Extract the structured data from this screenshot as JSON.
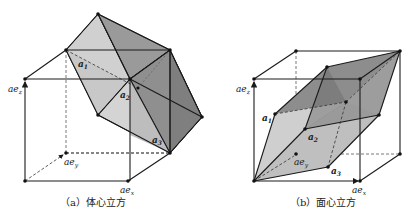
{
  "figures": [
    {
      "id": "bcc",
      "caption": "（a）体心立方",
      "labels": {
        "ez": "ae",
        "ez_sub": "z",
        "ey": "ae",
        "ey_sub": "y",
        "ex": "ae",
        "ex_sub": "x",
        "a1": "a",
        "a1_sub": "1",
        "a2": "a",
        "a2_sub": "2",
        "a3": "a",
        "a3_sub": "3"
      }
    },
    {
      "id": "fcc",
      "caption": "（b）面心立方",
      "labels": {
        "ez": "ae",
        "ez_sub": "z",
        "ey": "ae",
        "ey_sub": "y",
        "ex": "ae",
        "ex_sub": "x",
        "a1": "a",
        "a1_sub": "1",
        "a2": "a",
        "a2_sub": "2",
        "a3": "a",
        "a3_sub": "3"
      }
    }
  ],
  "colors": {
    "light_face": "#d4d4d4",
    "mid_face": "#a9a9a9",
    "dark_face": "#8a8a8a",
    "line": "#1a1a1a"
  }
}
